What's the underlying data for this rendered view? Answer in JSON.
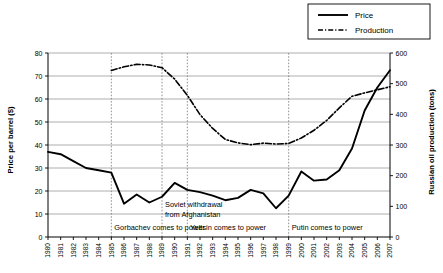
{
  "chart_data": {
    "type": "line",
    "title": "",
    "xlabel": "",
    "ylabel": "Price per barrel ($)",
    "y2label": "Russian oil production (tons)",
    "ylim": [
      0,
      80
    ],
    "y2lim": [
      0,
      600
    ],
    "yticks": [
      "0",
      "10",
      "20",
      "30",
      "40",
      "50",
      "60",
      "70",
      "80"
    ],
    "y2ticks": [
      "0",
      "100",
      "200",
      "300",
      "400",
      "500",
      "600"
    ],
    "grid": true,
    "legend_position": "top-right",
    "categories": [
      "1980",
      "1981",
      "1982",
      "1983",
      "1984",
      "1985",
      "1986",
      "1987",
      "1988",
      "1989",
      "1990",
      "1991",
      "1992",
      "1993",
      "1994",
      "1995",
      "1996",
      "1997",
      "1998",
      "1999",
      "2000",
      "2001",
      "2002",
      "2003",
      "2004",
      "2005",
      "2006",
      "2007"
    ],
    "series": [
      {
        "name": "Price",
        "axis": "left",
        "style": "solid",
        "values": [
          37,
          36,
          33,
          30,
          29,
          28,
          14.5,
          18.5,
          15,
          17.5,
          23.5,
          20.5,
          19.5,
          18,
          16,
          17,
          20.5,
          19,
          12.5,
          18,
          28.5,
          24.5,
          25,
          29,
          38.5,
          55,
          65,
          72.5
        ]
      },
      {
        "name": "Production",
        "axis": "right",
        "style": "dash-dot",
        "values": [
          null,
          null,
          null,
          null,
          null,
          543,
          555,
          563,
          561,
          552,
          515,
          462,
          399,
          354,
          318,
          307,
          301,
          306,
          303,
          305,
          323,
          348,
          380,
          421,
          459,
          470,
          480,
          490
        ]
      }
    ],
    "event_lines": [
      {
        "year": "1985",
        "label": "Gorbachev comes to power"
      },
      {
        "year": "1989",
        "label": "Soviet withdrawal from Afghanistan"
      },
      {
        "year": "1991",
        "label": "Yeltsin comes to power"
      },
      {
        "year": "1999",
        "label": "Putin comes to power"
      }
    ],
    "annotations": [
      {
        "text": "Soviet withdrawal",
        "anchor_year": "1989",
        "row": 1
      },
      {
        "text": "from Afghanistan",
        "anchor_year": "1989",
        "row": 2
      },
      {
        "text": "Gorbachev comes to power",
        "anchor_year": "1985",
        "row": 3
      },
      {
        "text": "Yeltsin comes to power",
        "anchor_year": "1991",
        "row": 3
      },
      {
        "text": "Putin comes to power",
        "anchor_year": "1999",
        "row": 3
      }
    ]
  },
  "legend": {
    "items": [
      {
        "label": "Price"
      },
      {
        "label": "Production"
      }
    ]
  },
  "axes": {
    "left_title": "Price per barrel ($)",
    "right_title": "Russian oil production (tons)"
  },
  "colors": {
    "series_line": "#000000",
    "grid": "#9a9a9a",
    "event_line": "#777777",
    "background": "#ffffff"
  }
}
